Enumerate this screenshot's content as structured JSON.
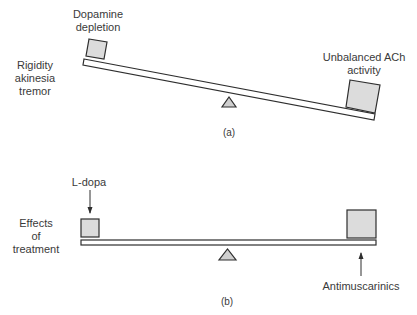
{
  "panel_a": {
    "caption": "(a)",
    "left_label_lines": [
      "Rigidity",
      "akinesia",
      "tremor"
    ],
    "left_weight_label_lines": [
      "Dopamine",
      "depletion"
    ],
    "right_weight_label_lines": [
      "Unbalanced ACh",
      "activity"
    ],
    "state": "tilted toward right (imbalanced)"
  },
  "panel_b": {
    "caption": "(b)",
    "left_label_lines": [
      "Effects",
      "of",
      "treatment"
    ],
    "left_arrow_label": "L-dopa",
    "right_arrow_label": "Antimuscarinics",
    "state": "level (balanced)"
  },
  "colors": {
    "box_fill": "#dcdcdc",
    "stroke": "#2e2e2e",
    "background": "#ffffff"
  }
}
